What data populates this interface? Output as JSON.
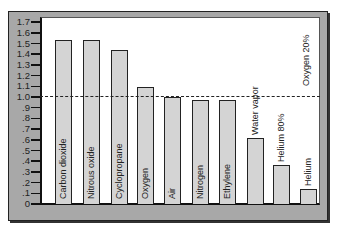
{
  "chart_data": {
    "type": "bar",
    "title": "",
    "xlabel": "",
    "ylabel": "",
    "ylim": [
      0,
      1.7
    ],
    "yticks": [
      "0",
      ".1",
      ".2",
      ".3",
      ".4",
      ".5",
      ".6",
      ".7",
      ".8",
      ".9",
      "1.0",
      "1.1",
      "1.2",
      "1.3",
      "1.4",
      "1.5",
      "1.6",
      "1.7"
    ],
    "categories": [
      "Carbon dioxide",
      "Nitrous oxide",
      "Cyclopropane",
      "Oxygen",
      "Air",
      "Nitrogen",
      "Ethylene",
      "Water vapor",
      "Helium 80% Oxygen 20%",
      "Helium"
    ],
    "values": [
      1.53,
      1.53,
      1.44,
      1.09,
      1.0,
      0.97,
      0.97,
      0.62,
      0.36,
      0.14
    ],
    "reference_line": {
      "value": 1.0,
      "style": "dashed"
    },
    "grid": false,
    "legend": null
  },
  "labels": {
    "bars": [
      "Carbon dioxide",
      "Nitrous oxide",
      "Cyclopropane",
      "Oxygen",
      "Air",
      "Nitrogen",
      "Ethylene",
      "Water vapor",
      "Helium 80%",
      "Helium"
    ],
    "extra": "Oxygen 20%"
  },
  "colors": {
    "frame": "#a8a8a8",
    "bar_fill": "#d4d4d4",
    "bar_stroke": "#222222",
    "plot_bg": "#ffffff"
  }
}
